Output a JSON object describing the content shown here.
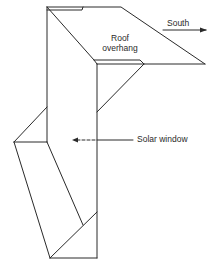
{
  "diagram": {
    "labels": {
      "roof_line1": "Roof",
      "roof_line2": "overhang",
      "south": "South",
      "solar_window": "Solar window"
    },
    "colors": {
      "line": "#2a2a2a",
      "background": "#ffffff"
    }
  }
}
